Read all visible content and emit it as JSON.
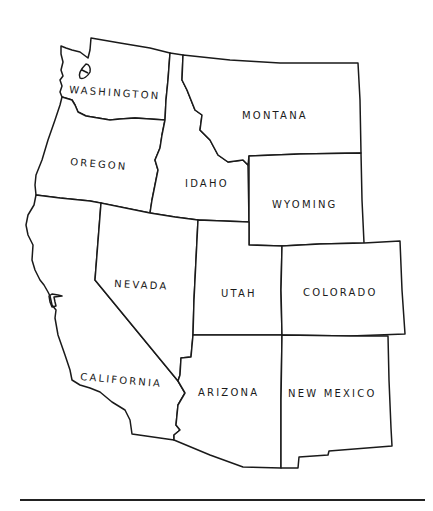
{
  "map": {
    "region": "Western United States",
    "line_color": "#1a1a1a",
    "background": "#ffffff",
    "states": [
      {
        "id": "washington",
        "label": "WASHINGTON"
      },
      {
        "id": "oregon",
        "label": "OREGON"
      },
      {
        "id": "california",
        "label": "CALIFORNIA"
      },
      {
        "id": "idaho",
        "label": "IDAHO"
      },
      {
        "id": "montana",
        "label": "MONTANA"
      },
      {
        "id": "wyoming",
        "label": "WYOMING"
      },
      {
        "id": "nevada",
        "label": "NEVADA"
      },
      {
        "id": "utah",
        "label": "UTAH"
      },
      {
        "id": "colorado",
        "label": "COLORADO"
      },
      {
        "id": "arizona",
        "label": "ARIZONA"
      },
      {
        "id": "new_mexico",
        "label": "NEW MEXICO"
      }
    ]
  }
}
